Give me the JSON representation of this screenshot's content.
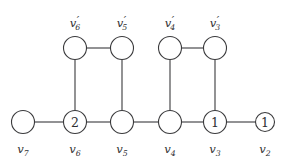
{
  "figure": {
    "background_color": "#ffffff",
    "stroke_color": "#3a3a3c",
    "text_color": "#2e2e30"
  },
  "graph_data": {
    "type": "graph",
    "layout": "two-row-ladder",
    "nodes": [
      {
        "id": "v7",
        "label_base": "v",
        "label_sub": "7",
        "prime": false,
        "value": "",
        "x": 23,
        "y": 122,
        "r": 11.5,
        "label_x": 23,
        "label_y": 153,
        "label_pos": "below"
      },
      {
        "id": "v6",
        "label_base": "v",
        "label_sub": "6",
        "prime": false,
        "value": "2",
        "x": 75,
        "y": 122,
        "r": 11.5,
        "label_x": 75,
        "label_y": 153,
        "label_pos": "below"
      },
      {
        "id": "v5",
        "label_base": "v",
        "label_sub": "5",
        "prime": false,
        "value": "",
        "x": 122,
        "y": 122,
        "r": 11.5,
        "label_x": 122,
        "label_y": 153,
        "label_pos": "below"
      },
      {
        "id": "v4",
        "label_base": "v",
        "label_sub": "4",
        "prime": false,
        "value": "",
        "x": 170,
        "y": 122,
        "r": 11.5,
        "label_x": 170,
        "label_y": 153,
        "label_pos": "below"
      },
      {
        "id": "v3",
        "label_base": "v",
        "label_sub": "3",
        "prime": false,
        "value": "1",
        "x": 215,
        "y": 122,
        "r": 11.5,
        "label_x": 215,
        "label_y": 153,
        "label_pos": "below"
      },
      {
        "id": "v2",
        "label_base": "v",
        "label_sub": "2",
        "prime": false,
        "value": "1",
        "x": 265,
        "y": 122,
        "r": 9.5,
        "label_x": 265,
        "label_y": 153,
        "label_pos": "below"
      },
      {
        "id": "v6p",
        "label_base": "v",
        "label_sub": "6",
        "prime": true,
        "value": "",
        "x": 75,
        "y": 48,
        "r": 11.5,
        "label_x": 75,
        "label_y": 27,
        "label_pos": "above"
      },
      {
        "id": "v5p",
        "label_base": "v",
        "label_sub": "5",
        "prime": true,
        "value": "",
        "x": 122,
        "y": 48,
        "r": 11.5,
        "label_x": 122,
        "label_y": 27,
        "label_pos": "above"
      },
      {
        "id": "v4p",
        "label_base": "v",
        "label_sub": "4",
        "prime": true,
        "value": "",
        "x": 170,
        "y": 48,
        "r": 11.5,
        "label_x": 170,
        "label_y": 27,
        "label_pos": "above"
      },
      {
        "id": "v3p",
        "label_base": "v",
        "label_sub": "3",
        "prime": true,
        "value": "",
        "x": 215,
        "y": 48,
        "r": 11.5,
        "label_x": 215,
        "label_y": 27,
        "label_pos": "above"
      }
    ],
    "edges": [
      {
        "id": "e-v7-v6",
        "from": "v7",
        "to": "v6",
        "orientation": "horizontal"
      },
      {
        "id": "e-v6-v5",
        "from": "v6",
        "to": "v5",
        "orientation": "horizontal"
      },
      {
        "id": "e-v5-v4",
        "from": "v5",
        "to": "v4",
        "orientation": "horizontal"
      },
      {
        "id": "e-v4-v3",
        "from": "v4",
        "to": "v3",
        "orientation": "horizontal"
      },
      {
        "id": "e-v3-v2",
        "from": "v3",
        "to": "v2",
        "orientation": "horizontal"
      },
      {
        "id": "e-v6p-v5p",
        "from": "v6p",
        "to": "v5p",
        "orientation": "horizontal"
      },
      {
        "id": "e-v4p-v3p",
        "from": "v4p",
        "to": "v3p",
        "orientation": "horizontal"
      },
      {
        "id": "e-v6p-v6",
        "from": "v6p",
        "to": "v6",
        "orientation": "vertical"
      },
      {
        "id": "e-v5p-v5",
        "from": "v5p",
        "to": "v5",
        "orientation": "vertical"
      },
      {
        "id": "e-v4p-v4",
        "from": "v4p",
        "to": "v4",
        "orientation": "vertical"
      },
      {
        "id": "e-v3p-v3",
        "from": "v3p",
        "to": "v3",
        "orientation": "vertical"
      }
    ]
  }
}
